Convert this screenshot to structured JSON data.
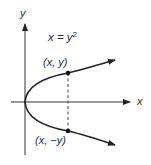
{
  "diagram": {
    "equation": {
      "lhs": "x = y",
      "exponent": "2"
    },
    "axes": {
      "x_label": "x",
      "y_label": "y"
    },
    "points": [
      {
        "label": "(x, y)",
        "position": "upper"
      },
      {
        "label": "(x, −y)",
        "position": "lower"
      }
    ],
    "colors": {
      "stroke": "#222222",
      "dashed": "#444444",
      "text": "#2a2a2a"
    }
  }
}
